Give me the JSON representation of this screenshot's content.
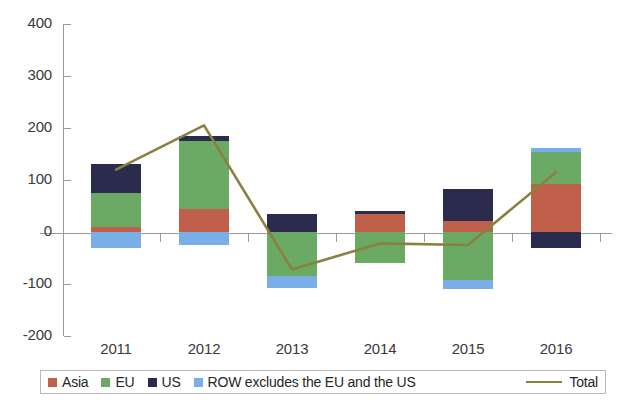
{
  "chart_data": {
    "type": "bar",
    "title": "",
    "subtitle": "",
    "xlabel": "",
    "ylabel": "",
    "categories": [
      "2011",
      "2012",
      "2013",
      "2014",
      "2015",
      "2016"
    ],
    "ylim": [
      -200,
      400
    ],
    "ytick_labels": [
      "400",
      "300",
      "200",
      "100",
      "0",
      "-100",
      "-200"
    ],
    "ytick_values": [
      400,
      300,
      200,
      100,
      0,
      -100,
      -200
    ],
    "grid": false,
    "stacked": true,
    "legend_position": "bottom",
    "series": [
      {
        "name": "Asia",
        "color": "#c0604a",
        "values": [
          10,
          45,
          0,
          35,
          22,
          92
        ]
      },
      {
        "name": "EU",
        "color": "#6aaa64",
        "values": [
          65,
          130,
          -85,
          -60,
          -92,
          62
        ]
      },
      {
        "name": "US",
        "color": "#2b2b4d",
        "values": [
          55,
          10,
          35,
          5,
          60,
          -30
        ]
      },
      {
        "name": "ROW excludes the EU and the US",
        "color": "#7aaee8",
        "values": [
          -30,
          -25,
          -22,
          0,
          -18,
          8
        ]
      }
    ],
    "line_series": {
      "name": "Total",
      "color": "#8a8040",
      "values": [
        120,
        205,
        -72,
        -22,
        -25,
        115
      ]
    }
  },
  "legend": {
    "items": [
      {
        "label": "Asia",
        "color": "#c0604a"
      },
      {
        "label": "EU",
        "color": "#6aaa64"
      },
      {
        "label": "US",
        "color": "#2b2b4d"
      },
      {
        "label": "ROW excludes the EU and the US",
        "color": "#7aaee8"
      }
    ],
    "line_label": "Total",
    "line_color": "#8a8040"
  }
}
